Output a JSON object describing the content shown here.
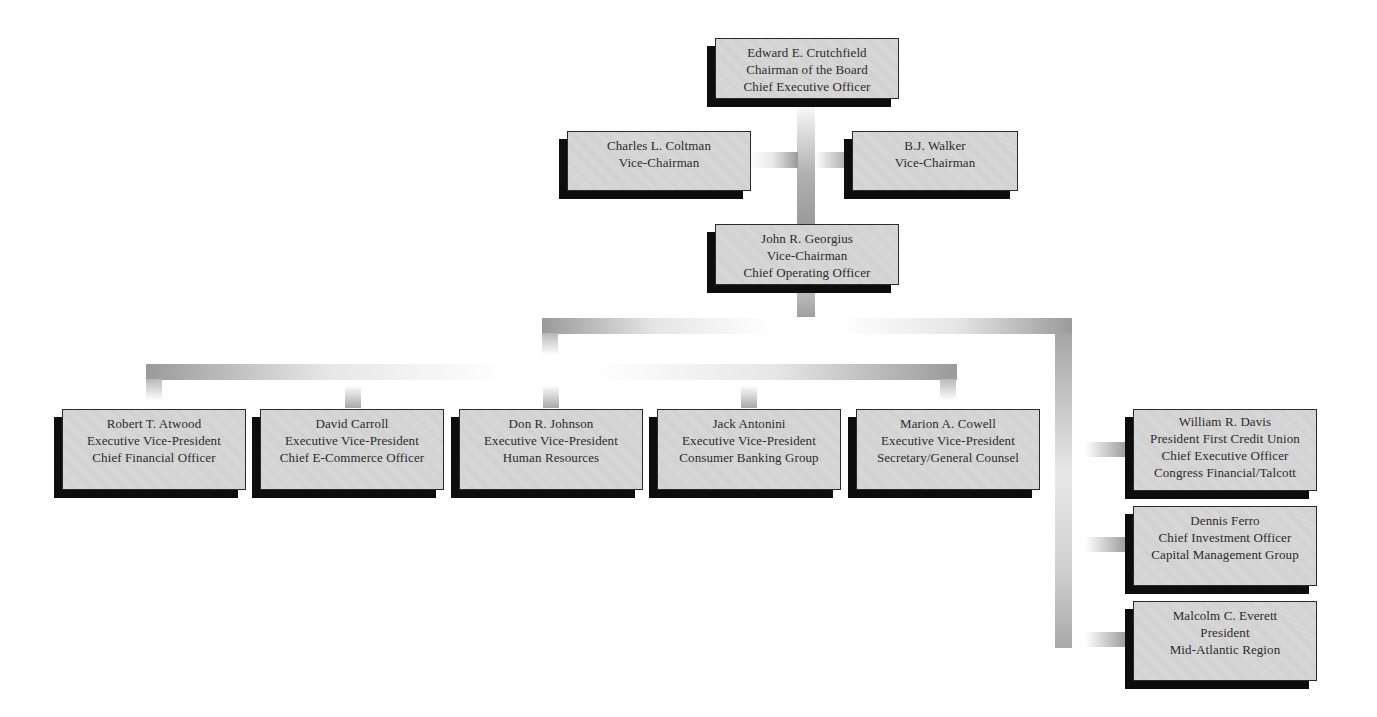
{
  "chart": {
    "type": "organization-chart",
    "nodes": [
      {
        "id": "crutchfield",
        "lines": [
          "Edward E. Crutchfield",
          "Chairman of the Board",
          "Chief Executive Officer"
        ]
      },
      {
        "id": "coltman",
        "lines": [
          "Charles L. Coltman",
          "Vice-Chairman"
        ]
      },
      {
        "id": "walker",
        "lines": [
          "B.J. Walker",
          "Vice-Chairman"
        ]
      },
      {
        "id": "georgius",
        "lines": [
          "John R. Georgius",
          "Vice-Chairman",
          "Chief Operating Officer"
        ]
      },
      {
        "id": "atwood",
        "lines": [
          "Robert T. Atwood",
          "Executive Vice-President",
          "Chief Financial Officer"
        ]
      },
      {
        "id": "carroll",
        "lines": [
          "David Carroll",
          "Executive Vice-President",
          "Chief E-Commerce Officer"
        ]
      },
      {
        "id": "johnson",
        "lines": [
          "Don R. Johnson",
          "Executive Vice-President",
          "Human Resources"
        ]
      },
      {
        "id": "antonini",
        "lines": [
          "Jack Antonini",
          "Executive Vice-President",
          "Consumer Banking Group"
        ]
      },
      {
        "id": "cowell",
        "lines": [
          "Marion A. Cowell",
          "Executive Vice-President",
          "Secretary/General Counsel"
        ]
      },
      {
        "id": "davis",
        "lines": [
          "William R. Davis",
          "President First Credit Union",
          "Chief Executive Officer",
          "Congress Financial/Talcott"
        ]
      },
      {
        "id": "ferro",
        "lines": [
          "Dennis Ferro",
          "Chief Investment Officer",
          "Capital Management Group"
        ]
      },
      {
        "id": "everett",
        "lines": [
          "Malcolm C. Everett",
          "President",
          "Mid-Atlantic Region"
        ]
      }
    ]
  },
  "colors": {
    "box_fill": "#d6d6d6",
    "box_border": "#2a2a2a",
    "shadow": "#0d0d0d",
    "connector": "#9a9a9a",
    "text": "#2b2b2b"
  }
}
